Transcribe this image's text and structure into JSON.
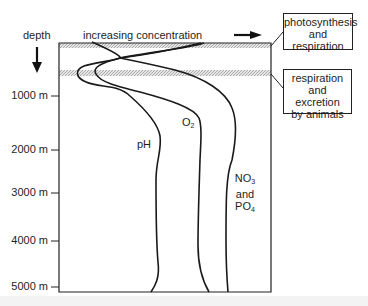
{
  "axis": {
    "y_title": "depth",
    "ticks": [
      {
        "label": "1000 m",
        "y": 96
      },
      {
        "label": "2000 m",
        "y": 150
      },
      {
        "label": "3000 m",
        "y": 193
      },
      {
        "label": "4000 m",
        "y": 241
      },
      {
        "label": "5000 m",
        "y": 287
      }
    ]
  },
  "header": {
    "x_title": "increasing concentration"
  },
  "curves": {
    "ph": {
      "label": "pH"
    },
    "o2": {
      "label_main": "O",
      "label_sub": "2"
    },
    "nutrients": {
      "line1_main": "NO",
      "line1_sub": "3",
      "line2": "and",
      "line3_main": "PO",
      "line3_sub": "4"
    }
  },
  "annotations": {
    "upper_band": {
      "lines": [
        "photosynthesis",
        "and",
        "respiration"
      ]
    },
    "lower_band": {
      "lines": [
        "respiration",
        "and",
        "excretion",
        "by animals"
      ]
    }
  },
  "colors": {
    "ink": "#1e1e1e",
    "band": "#c8c8c8"
  }
}
